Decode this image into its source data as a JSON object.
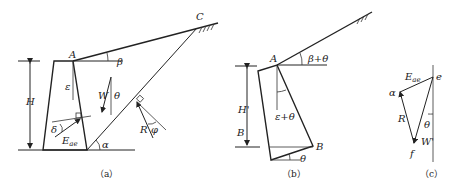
{
  "figure": {
    "panels": [
      {
        "id": "a",
        "caption": "（a）"
      },
      {
        "id": "b",
        "caption": "（b）"
      },
      {
        "id": "c",
        "caption": "（c）"
      }
    ],
    "panel_a": {
      "labels": {
        "A": "A",
        "C": "C",
        "beta": "β",
        "H": "H",
        "epsilon": "ε",
        "W": "W",
        "theta": "θ",
        "delta": "δ",
        "E": "E",
        "E_sub": "ae",
        "alpha": "α",
        "R": "R",
        "phi": "φ"
      }
    },
    "panel_b": {
      "labels": {
        "A": "A",
        "beta_theta": "β+θ",
        "H_prime": "H'",
        "B_left": "B",
        "eps_theta": "ε+θ",
        "B": "B",
        "theta": "θ"
      }
    },
    "panel_c": {
      "labels": {
        "E": "E",
        "E_sub": "ae",
        "e": "e",
        "alpha": "α",
        "R": "R",
        "theta": "θ",
        "W_prime": "W'",
        "f": "f"
      }
    }
  }
}
